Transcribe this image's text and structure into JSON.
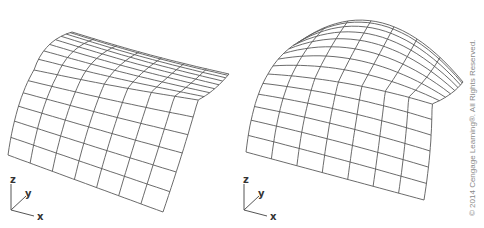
{
  "figure": {
    "panels": [
      {
        "id": "left",
        "description": "wireframe surface, gentle cylindrical curvature",
        "axes": {
          "z": "z",
          "y": "y",
          "x": "x"
        },
        "fine_rows": 8,
        "coarse_rows": 6,
        "columns": 7
      },
      {
        "id": "right",
        "description": "wireframe surface, doubly curved (dome-like)",
        "axes": {
          "z": "z",
          "y": "y",
          "x": "x"
        },
        "fine_rows": 8,
        "coarse_rows": 6,
        "columns": 7
      }
    ],
    "line_color": "#5a5a5a",
    "background": "#ffffff"
  },
  "copyright": "© 2014 Cengage Learning®. All Rights Reserved."
}
